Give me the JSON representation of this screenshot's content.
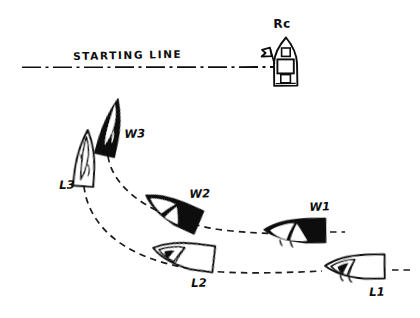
{
  "diagram": {
    "title_text": "STARTING LINE",
    "ink_color": "#111111",
    "background_color": "#ffffff",
    "labels": {
      "rc": "Rc",
      "w3": "W3",
      "w2": "W2",
      "w1": "W1",
      "l3": "L3",
      "l2": "L2",
      "l1": "L1"
    },
    "boats": [
      {
        "id": "w3",
        "label": "W3",
        "fill": "solid",
        "x": 110,
        "y": 130,
        "rotation": 12
      },
      {
        "id": "w2",
        "label": "W2",
        "fill": "solid",
        "x": 172,
        "y": 211,
        "rotation": 28
      },
      {
        "id": "w1",
        "label": "W1",
        "fill": "solid",
        "x": 300,
        "y": 232,
        "rotation": 2
      },
      {
        "id": "l3",
        "label": "L3",
        "fill": "outline",
        "x": 85,
        "y": 160,
        "rotation": 4
      },
      {
        "id": "l2",
        "label": "L2",
        "fill": "outline",
        "x": 184,
        "y": 256,
        "rotation": 12
      },
      {
        "id": "l1",
        "label": "L1",
        "fill": "outline",
        "x": 360,
        "y": 268,
        "rotation": 2
      }
    ],
    "committee_boat": {
      "id": "rc",
      "label": "Rc",
      "x": 286,
      "y": 63,
      "has_flag": true
    },
    "lines": {
      "starting_line": {
        "style": "dash-dot",
        "x1": 22,
        "x2": 283,
        "y": 67
      },
      "w_track": {
        "style": "dashed",
        "from": "W3",
        "to": "W1"
      },
      "l_track": {
        "style": "dashed",
        "from": "L3",
        "to": "L1"
      },
      "w1_reference": {
        "style": "dashed",
        "orientation": "vertical"
      }
    }
  }
}
